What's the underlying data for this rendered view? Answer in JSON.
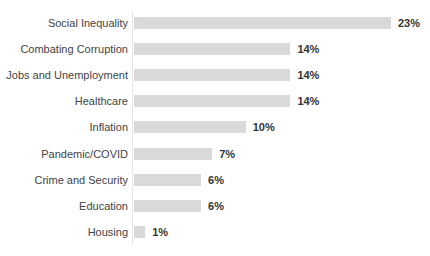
{
  "chart_data": {
    "type": "bar",
    "orientation": "horizontal",
    "title": "",
    "subtitle": "",
    "xlabel": "",
    "ylabel": "",
    "grid": false,
    "legend": false,
    "axis_visible": true,
    "xlim": [
      0,
      23
    ],
    "value_suffix": "%",
    "bar_color": "#d9d9d9",
    "label_color": "#434343",
    "value_color": "#333333",
    "categories": [
      "Social Inequality",
      "Combating Corruption",
      "Jobs and Unemployment",
      "Healthcare",
      "Inflation",
      "Pandemic/COVID",
      "Crime and Security",
      "Education",
      "Housing"
    ],
    "values": [
      23,
      14,
      14,
      14,
      10,
      7,
      6,
      6,
      1
    ],
    "value_labels": [
      "23%",
      "14%",
      "14%",
      "14%",
      "10%",
      "7%",
      "6%",
      "6%",
      "1%"
    ]
  }
}
